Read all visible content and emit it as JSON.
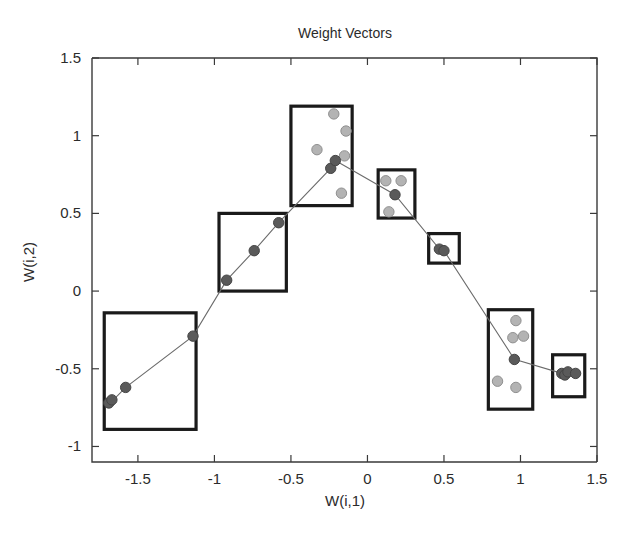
{
  "chart_data": {
    "type": "scatter",
    "title": "Weight Vectors",
    "xlabel": "W(i,1)",
    "ylabel": "W(i,2)",
    "xlim": [
      -1.8,
      1.5
    ],
    "ylim": [
      -1.1,
      1.5
    ],
    "xticks": [
      -1.5,
      -1,
      -0.5,
      0,
      0.5,
      1,
      1.5
    ],
    "xticklabels": [
      "-1.5",
      "-1",
      "-0.5",
      "0",
      "0.5",
      "1",
      "1.5"
    ],
    "yticks": [
      -1,
      -0.5,
      0,
      0.5,
      1,
      1.5
    ],
    "yticklabels": [
      "-1",
      "-0.5",
      "0",
      "0.5",
      "1",
      "1.5"
    ],
    "grid": false,
    "legend": "none",
    "series": [
      {
        "name": "weight vector nodes",
        "marker": "filled-circle-dark",
        "points": [
          {
            "x": -1.69,
            "y": -0.72
          },
          {
            "x": -1.67,
            "y": -0.7
          },
          {
            "x": -1.58,
            "y": -0.62
          },
          {
            "x": -1.14,
            "y": -0.29
          },
          {
            "x": -0.92,
            "y": 0.07
          },
          {
            "x": -0.74,
            "y": 0.26
          },
          {
            "x": -0.58,
            "y": 0.44
          },
          {
            "x": -0.24,
            "y": 0.79
          },
          {
            "x": -0.21,
            "y": 0.84
          },
          {
            "x": 0.18,
            "y": 0.62
          },
          {
            "x": 0.47,
            "y": 0.27
          },
          {
            "x": 0.5,
            "y": 0.26
          },
          {
            "x": 0.96,
            "y": -0.44
          },
          {
            "x": 1.27,
            "y": -0.53
          },
          {
            "x": 1.29,
            "y": -0.54
          },
          {
            "x": 1.31,
            "y": -0.52
          },
          {
            "x": 1.36,
            "y": -0.53
          }
        ]
      },
      {
        "name": "data samples",
        "marker": "circle-light",
        "points": [
          {
            "x": -0.22,
            "y": 1.14
          },
          {
            "x": -0.14,
            "y": 1.03
          },
          {
            "x": -0.33,
            "y": 0.91
          },
          {
            "x": -0.15,
            "y": 0.87
          },
          {
            "x": -0.17,
            "y": 0.63
          },
          {
            "x": 0.12,
            "y": 0.71
          },
          {
            "x": 0.22,
            "y": 0.71
          },
          {
            "x": 0.14,
            "y": 0.51
          },
          {
            "x": 0.97,
            "y": -0.19
          },
          {
            "x": 0.95,
            "y": -0.3
          },
          {
            "x": 1.02,
            "y": -0.29
          },
          {
            "x": 0.85,
            "y": -0.58
          },
          {
            "x": 0.97,
            "y": -0.62
          }
        ]
      }
    ],
    "polyline": {
      "name": "weight vector chain",
      "points": [
        {
          "x": -1.7,
          "y": -0.73
        },
        {
          "x": -1.66,
          "y": -0.7
        },
        {
          "x": -1.58,
          "y": -0.62
        },
        {
          "x": -1.14,
          "y": -0.29
        },
        {
          "x": -0.92,
          "y": 0.07
        },
        {
          "x": -0.74,
          "y": 0.26
        },
        {
          "x": -0.58,
          "y": 0.44
        },
        {
          "x": -0.24,
          "y": 0.79
        },
        {
          "x": -0.21,
          "y": 0.84
        },
        {
          "x": 0.18,
          "y": 0.62
        },
        {
          "x": 0.47,
          "y": 0.27
        },
        {
          "x": 0.5,
          "y": 0.26
        },
        {
          "x": 0.96,
          "y": -0.44
        },
        {
          "x": 1.27,
          "y": -0.53
        },
        {
          "x": 1.36,
          "y": -0.53
        }
      ]
    },
    "cluster_boxes": [
      {
        "label": "cluster-box-1",
        "x0": -1.72,
        "y0": -0.89,
        "x1": -1.12,
        "y1": -0.14
      },
      {
        "label": "cluster-box-2",
        "x0": -0.97,
        "y0": 0.0,
        "x1": -0.53,
        "y1": 0.5
      },
      {
        "label": "cluster-box-3",
        "x0": -0.5,
        "y0": 0.55,
        "x1": -0.1,
        "y1": 1.19
      },
      {
        "label": "cluster-box-4",
        "x0": 0.07,
        "y0": 0.47,
        "x1": 0.31,
        "y1": 0.78
      },
      {
        "label": "cluster-box-5",
        "x0": 0.4,
        "y0": 0.18,
        "x1": 0.6,
        "y1": 0.37
      },
      {
        "label": "cluster-box-6",
        "x0": 0.79,
        "y0": -0.76,
        "x1": 1.08,
        "y1": -0.12
      },
      {
        "label": "cluster-box-7",
        "x0": 1.21,
        "y0": -0.68,
        "x1": 1.42,
        "y1": -0.41
      }
    ]
  },
  "colors": {
    "background": "#ffffff",
    "axis": "#3a3a3a",
    "box_stroke": "#1a1a1a",
    "line": "#6b6b6b",
    "marker_light": "#b3b3b3",
    "marker_dark": "#6e6e6e"
  }
}
